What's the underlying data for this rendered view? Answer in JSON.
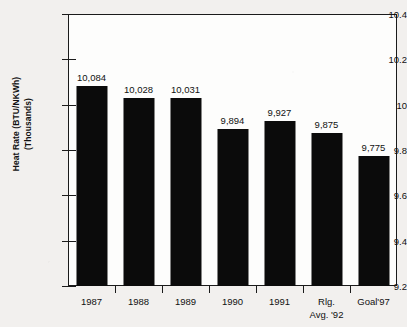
{
  "chart_data": {
    "type": "bar",
    "title": "",
    "subtitle": "",
    "xlabel": "",
    "ylabel": "Heat Rate (BTU/NKWh)",
    "ylabel_line2": "(Thousands)",
    "categories": [
      "1987",
      "1988",
      "1989",
      "1990",
      "1991",
      "Rlg.",
      "Goal'97"
    ],
    "category_sublabels": [
      "",
      "",
      "",
      "",
      "",
      "Avg. '92",
      ""
    ],
    "values": [
      10.084,
      10.028,
      10.031,
      9.894,
      9.927,
      9.875,
      9.775
    ],
    "data_labels": [
      "10,084",
      "10,028",
      "10,031",
      "9,894",
      "9,927",
      "9,875",
      "9,775"
    ],
    "ylim": [
      9.2,
      10.4
    ],
    "yticks": [
      10.4,
      10.2,
      10,
      9.8,
      9.6,
      9.4,
      9.2
    ],
    "ytick_labels": [
      "10.4",
      "10.2",
      "10",
      "9.8",
      "9.6",
      "9.4",
      "9.2"
    ],
    "grid": false,
    "legend": null,
    "bar_color": "#0b0b0b",
    "axis_color": "#1b1b1b",
    "background_color": "#f2f0ee",
    "plot_background_color": "#fdfdfc"
  }
}
